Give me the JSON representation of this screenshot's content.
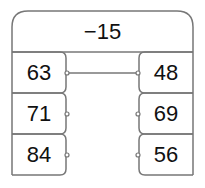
{
  "header": {
    "value": "−15"
  },
  "left_column": [
    {
      "value": "63"
    },
    {
      "value": "71"
    },
    {
      "value": "84"
    }
  ],
  "right_column": [
    {
      "value": "48"
    },
    {
      "value": "69"
    },
    {
      "value": "56"
    }
  ],
  "connection": {
    "from": "63",
    "to": "48"
  },
  "colors": {
    "stroke": "#777777",
    "text": "#111111",
    "background": "#ffffff"
  }
}
